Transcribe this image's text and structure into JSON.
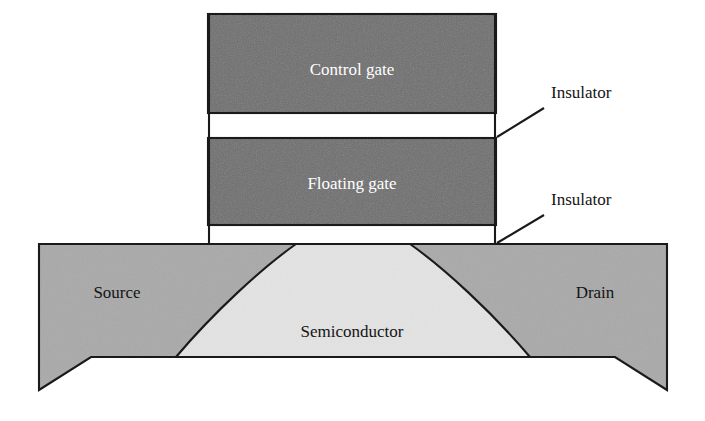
{
  "diagram": {
    "background_color": "#ffffff",
    "outline_color": "#1a1a1a"
  },
  "layers": {
    "control_gate": {
      "label": "Control gate",
      "fill": "#6e6e6e",
      "text_color": "#ffffff",
      "x": 208,
      "y": 14,
      "width": 288,
      "height": 99
    },
    "upper_insulator": {
      "label": "Insulator",
      "fill": "#ffffff",
      "x": 208,
      "y": 113,
      "width": 288,
      "height": 25
    },
    "floating_gate": {
      "label": "Floating gate",
      "fill": "#6e6e6e",
      "text_color": "#ffffff",
      "x": 208,
      "y": 138,
      "width": 288,
      "height": 87
    },
    "lower_insulator": {
      "label": "Insulator",
      "fill": "#ffffff",
      "x": 208,
      "y": 225,
      "width": 288,
      "height": 19
    },
    "source": {
      "label": "Source",
      "fill": "#a9a9a9",
      "text_color": "#141414",
      "label_x": 117,
      "label_y": 294
    },
    "drain": {
      "label": "Drain",
      "fill": "#a9a9a9",
      "text_color": "#141414",
      "label_x": 595,
      "label_y": 294
    },
    "semiconductor": {
      "label": "Semiconductor",
      "fill": "#e3e3e3",
      "text_color": "#141414",
      "label_x": 352,
      "label_y": 333
    }
  },
  "callouts": [
    {
      "label": "Insulator",
      "text_x": 551,
      "text_y": 94,
      "leader_from_x": 544,
      "leader_from_y": 108,
      "leader_to_x": 497,
      "leader_to_y": 137
    },
    {
      "label": "Insulator",
      "text_x": 551,
      "text_y": 201,
      "leader_from_x": 544,
      "leader_from_y": 215,
      "leader_to_x": 497,
      "leader_to_y": 243
    }
  ],
  "substrate": {
    "top_y": 244,
    "left_x": 39,
    "right_x": 667,
    "bottom_y": 375,
    "corner_bottom_y": 390,
    "corner_inset": 52
  }
}
